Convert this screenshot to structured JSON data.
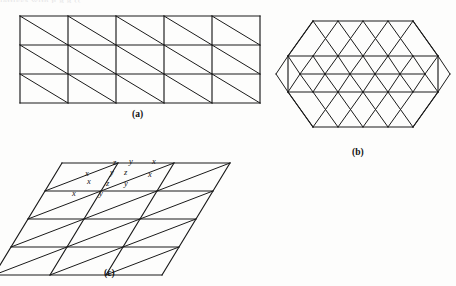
{
  "page": {
    "background_color": "#fdfdfc",
    "ink_color": "#1a1a1a",
    "width": 456,
    "height": 286,
    "top_bleed_text": "lattices with            p                 g                 g  (("
  },
  "figures": {
    "a": {
      "caption": "(a)",
      "kind": "rectangular-grid-with-diagonals",
      "columns": 5,
      "rows": 3,
      "origin": {
        "x": 20,
        "y": 16
      },
      "cell": {
        "width": 48,
        "height": 29
      },
      "diagonal_direction": "top-left-to-bottom-right"
    },
    "b": {
      "caption": "(b)",
      "kind": "hexagonal-triangular-lattice",
      "rows": 4,
      "center": {
        "x": 363,
        "y": 92
      },
      "side_units": 2,
      "edge": 25
    },
    "c": {
      "caption": "(c)",
      "kind": "parallelogram-grid-with-diagonals",
      "columns": 3,
      "rows": 4,
      "origin": {
        "x": 62,
        "y": 163
      },
      "cell": {
        "width": 56,
        "height": 28
      },
      "skew_x": 17,
      "labels": [
        {
          "text": "z",
          "x": 113,
          "y": 163
        },
        {
          "text": "y",
          "x": 129,
          "y": 163
        },
        {
          "text": "x",
          "x": 152,
          "y": 163
        },
        {
          "text": "x",
          "x": 85,
          "y": 175
        },
        {
          "text": "y",
          "x": 110,
          "y": 175
        },
        {
          "text": "z",
          "x": 124,
          "y": 175
        },
        {
          "text": "x",
          "x": 148,
          "y": 177
        },
        {
          "text": "x",
          "x": 87,
          "y": 184
        },
        {
          "text": "z",
          "x": 106,
          "y": 186
        },
        {
          "text": "y",
          "x": 124,
          "y": 186
        },
        {
          "text": "x",
          "x": 72,
          "y": 196
        },
        {
          "text": "y",
          "x": 99,
          "y": 196
        }
      ]
    }
  }
}
